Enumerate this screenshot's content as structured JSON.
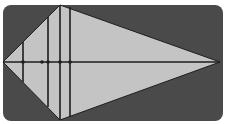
{
  "diagram": {
    "type": "kite-with-cross-sections",
    "colors": {
      "page_background": "#ffffff",
      "panel_background": "#4a4a4a",
      "shape_fill": "#c4c4c4",
      "line": "#1e1e1e"
    },
    "panel": {
      "x": 3,
      "y": 5,
      "width": 220,
      "height": 116,
      "corner_radius": 8
    },
    "kite": {
      "vertices": {
        "left": [
          3,
          62
        ],
        "top": [
          60,
          5
        ],
        "right": [
          220,
          62
        ],
        "bottom": [
          60,
          120
        ]
      }
    },
    "axis": {
      "y": 62,
      "x1": 3,
      "x2": 220
    },
    "vertical_lines": [
      {
        "x": 23,
        "y1": 42,
        "y2": 82
      },
      {
        "x": 48,
        "y1": 17,
        "y2": 107
      },
      {
        "x": 60,
        "y1": 5,
        "y2": 120
      },
      {
        "x": 70,
        "y1": 7,
        "y2": 117
      }
    ],
    "marks": [
      {
        "x": 23,
        "y": 62
      },
      {
        "x": 42,
        "y": 62
      },
      {
        "x": 48,
        "y": 62
      },
      {
        "x": 60,
        "y": 62
      },
      {
        "x": 70,
        "y": 62
      }
    ]
  }
}
